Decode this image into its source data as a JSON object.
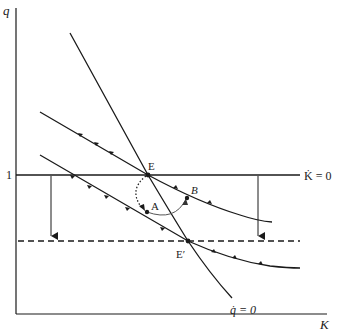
{
  "figure": {
    "type": "phase-diagram",
    "axes": {
      "y_label": "q",
      "x_label": "K",
      "y_tick_label": "1"
    },
    "loci": {
      "k_dot_zero": "K̇ = 0",
      "q_dot_zero": "q̇ = 0"
    },
    "points": {
      "E": "E",
      "E_prime": "E′",
      "A": "A",
      "B": "B"
    },
    "colors": {
      "line": "#1a1a1a",
      "background": "#ffffff",
      "arc": "#555555"
    }
  }
}
